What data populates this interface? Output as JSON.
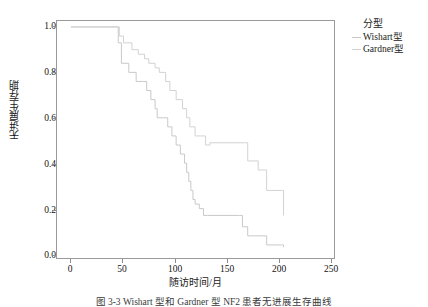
{
  "figure": {
    "caption": "图 3-3  Wishart 型和 Gardner 型 NF2 患者无进展生存曲线"
  },
  "legend": {
    "title": "分型",
    "position": "right",
    "items": [
      {
        "label": "Wishart型",
        "color": "#c9c9c9"
      },
      {
        "label": "Gardner型",
        "color": "#d2d2d2"
      }
    ]
  },
  "axes": {
    "x_title": "随访时间/月",
    "y_title": "无进展生存期",
    "x_ticks": [
      "0",
      "50",
      "100",
      "150",
      "200",
      "250"
    ],
    "y_ticks": [
      "1.0",
      "0.8",
      "0.6",
      "0.4",
      "0.2",
      "0.0"
    ]
  },
  "chart_data": {
    "type": "line",
    "title": "",
    "subtitle": "",
    "xlabel": "随访时间/月",
    "ylabel": "无进展生存期",
    "xlim": [
      0,
      250
    ],
    "ylim": [
      0.0,
      1.0
    ],
    "xticks": [
      0,
      50,
      100,
      150,
      200,
      250
    ],
    "yticks": [
      0.0,
      0.2,
      0.4,
      0.6,
      0.8,
      1.0
    ],
    "grid": false,
    "legend_position": "right",
    "step_style": "post",
    "series": [
      {
        "name": "Wishart型",
        "color": "#c9c9c9",
        "points": [
          [
            0,
            1.0
          ],
          [
            45,
            1.0
          ],
          [
            45,
            0.93
          ],
          [
            48,
            0.93
          ],
          [
            48,
            0.84
          ],
          [
            55,
            0.84
          ],
          [
            55,
            0.8
          ],
          [
            62,
            0.8
          ],
          [
            62,
            0.76
          ],
          [
            68,
            0.76
          ],
          [
            72,
            0.72
          ],
          [
            76,
            0.68
          ],
          [
            80,
            0.64
          ],
          [
            82,
            0.6
          ],
          [
            92,
            0.6
          ],
          [
            92,
            0.56
          ],
          [
            96,
            0.52
          ],
          [
            100,
            0.48
          ],
          [
            104,
            0.44
          ],
          [
            108,
            0.4
          ],
          [
            110,
            0.36
          ],
          [
            112,
            0.32
          ],
          [
            114,
            0.28
          ],
          [
            116,
            0.24
          ],
          [
            118,
            0.22
          ],
          [
            122,
            0.2
          ],
          [
            126,
            0.17
          ],
          [
            130,
            0.17
          ],
          [
            160,
            0.17
          ],
          [
            163,
            0.12
          ],
          [
            168,
            0.08
          ],
          [
            175,
            0.08
          ],
          [
            186,
            0.04
          ],
          [
            200,
            0.04
          ],
          [
            202,
            0.03
          ]
        ]
      },
      {
        "name": "Gardner型",
        "color": "#d2d2d2",
        "points": [
          [
            0,
            1.0
          ],
          [
            45,
            1.0
          ],
          [
            46,
            0.96
          ],
          [
            50,
            0.93
          ],
          [
            58,
            0.9
          ],
          [
            64,
            0.88
          ],
          [
            70,
            0.86
          ],
          [
            74,
            0.84
          ],
          [
            80,
            0.82
          ],
          [
            84,
            0.8
          ],
          [
            90,
            0.76
          ],
          [
            94,
            0.72
          ],
          [
            100,
            0.72
          ],
          [
            100,
            0.68
          ],
          [
            106,
            0.64
          ],
          [
            110,
            0.6
          ],
          [
            113,
            0.56
          ],
          [
            118,
            0.52
          ],
          [
            124,
            0.52
          ],
          [
            128,
            0.48
          ],
          [
            132,
            0.49
          ],
          [
            160,
            0.49
          ],
          [
            165,
            0.49
          ],
          [
            168,
            0.41
          ],
          [
            178,
            0.37
          ],
          [
            185,
            0.37
          ],
          [
            186,
            0.28
          ],
          [
            200,
            0.28
          ],
          [
            202,
            0.17
          ]
        ]
      }
    ]
  }
}
